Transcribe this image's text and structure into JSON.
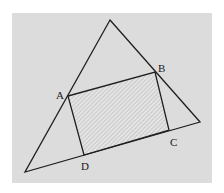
{
  "diagram": {
    "type": "geometry",
    "colors": {
      "background_panel": "#dcdcdc",
      "page": "#ffffff",
      "stroke": "#1f1f1f",
      "hatch": "#a8a8a8",
      "hatch_fill": "#e4e4e4"
    },
    "panel": {
      "x": 12,
      "y": 13,
      "width": 200,
      "height": 170
    },
    "triangle": {
      "vertices": [
        {
          "name": "top",
          "x": 110,
          "y": 20
        },
        {
          "name": "right",
          "x": 200,
          "y": 122
        },
        {
          "name": "bottom_left",
          "x": 25,
          "y": 172
        }
      ]
    },
    "rectangle": {
      "shaded": true,
      "pattern": "diagonal-hatch",
      "vertices": [
        {
          "name": "A",
          "x": 68,
          "y": 96
        },
        {
          "name": "B",
          "x": 155,
          "y": 72
        },
        {
          "name": "C",
          "x": 169,
          "y": 130
        },
        {
          "name": "D",
          "x": 84,
          "y": 155
        }
      ]
    },
    "labels": [
      {
        "id": "A",
        "text": "A",
        "x": 56,
        "y": 99
      },
      {
        "id": "B",
        "text": "B",
        "x": 158,
        "y": 72
      },
      {
        "id": "C",
        "text": "C",
        "x": 170,
        "y": 146
      },
      {
        "id": "D",
        "text": "D",
        "x": 81,
        "y": 170
      }
    ]
  }
}
